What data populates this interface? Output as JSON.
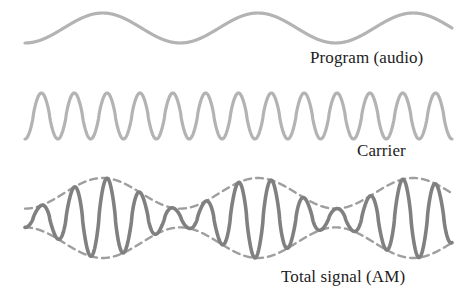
{
  "figure": {
    "background": "#ffffff",
    "width": 470,
    "height": 302
  },
  "labels": {
    "program": "Program (audio)",
    "carrier": "Carrier",
    "total": "Total signal (AM)"
  },
  "colors": {
    "light_wave": "#b3b3b3",
    "dark_wave": "#808080",
    "envelope": "#9e9e9e",
    "text": "#1c1c1c"
  },
  "chart_data": {
    "type": "line",
    "xlabel": "",
    "ylabel": "",
    "grid": false,
    "legend": "inline-right",
    "x_range": [
      25,
      452
    ],
    "series": [
      {
        "name": "Program (audio)",
        "label": "Program (audio)",
        "waveform": "sine",
        "color": "#b3b3b3",
        "stroke_width": 3.2,
        "cycles": 2.75,
        "phase_deg": -90,
        "center_y": 28,
        "amplitude": 15,
        "y_min": 13,
        "y_max": 43,
        "dashed": false
      },
      {
        "name": "Carrier",
        "label": "Carrier",
        "waveform": "sine",
        "color": "#b3b3b3",
        "stroke_width": 3.2,
        "cycles": 13,
        "phase_deg": -90,
        "center_y": 116,
        "amplitude": 23,
        "y_min": 93,
        "y_max": 139,
        "dashed": false
      },
      {
        "name": "Total signal (AM)",
        "label": "Total signal (AM)",
        "waveform": "am-modulated-sine",
        "color": "#808080",
        "stroke_width": 3.6,
        "carrier_cycles": 13,
        "modulation_cycles": 2.75,
        "modulation_index": 0.62,
        "phase_deg": -90,
        "center_y": 218,
        "amplitude": 40,
        "y_min": 178,
        "y_max": 258,
        "dashed": false
      },
      {
        "name": "AM upper envelope",
        "label": "",
        "waveform": "envelope-upper",
        "color": "#9e9e9e",
        "stroke_width": 2.4,
        "modulation_cycles": 2.75,
        "modulation_index": 0.62,
        "phase_deg": -90,
        "center_y": 218,
        "amplitude": 40,
        "dashed": true,
        "dash_pattern": "7,5"
      },
      {
        "name": "AM lower envelope",
        "label": "",
        "waveform": "envelope-lower",
        "color": "#9e9e9e",
        "stroke_width": 2.4,
        "modulation_cycles": 2.75,
        "modulation_index": 0.62,
        "phase_deg": -90,
        "center_y": 218,
        "amplitude": 40,
        "dashed": true,
        "dash_pattern": "7,5"
      }
    ]
  }
}
